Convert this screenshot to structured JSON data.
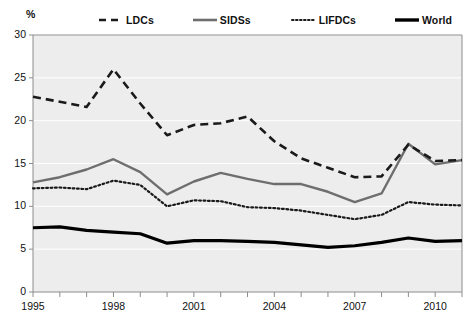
{
  "chart_data": {
    "type": "line",
    "title": "",
    "xlabel": "",
    "ylabel": "%",
    "ylim": [
      0,
      30
    ],
    "xlim": [
      1995,
      2011
    ],
    "yticks": [
      0,
      5,
      10,
      15,
      20,
      25,
      30
    ],
    "xticks": [
      1995,
      1998,
      2001,
      2004,
      2007,
      2010
    ],
    "grid": true,
    "legend_position": "top",
    "x": [
      1995,
      1996,
      1997,
      1998,
      1999,
      2000,
      2001,
      2002,
      2003,
      2004,
      2005,
      2006,
      2007,
      2008,
      2009,
      2010,
      2011
    ],
    "series": [
      {
        "name": "LDCs",
        "style": "dashed",
        "color": "#1a1a1a",
        "values": [
          22.8,
          22.2,
          21.6,
          26.0,
          22.0,
          18.3,
          19.5,
          19.7,
          20.5,
          17.6,
          15.6,
          14.5,
          13.4,
          13.5,
          17.2,
          15.3,
          15.4
        ]
      },
      {
        "name": "SIDSs",
        "style": "solid-medium",
        "color": "#6e6e6e",
        "values": [
          12.8,
          13.4,
          14.3,
          15.5,
          14.0,
          11.4,
          12.9,
          13.9,
          13.2,
          12.6,
          12.6,
          11.7,
          10.5,
          11.5,
          17.3,
          14.9,
          15.4
        ]
      },
      {
        "name": "LIFDCs",
        "style": "dotted",
        "color": "#1a1a1a",
        "values": [
          12.1,
          12.2,
          12.0,
          13.0,
          12.5,
          10.0,
          10.7,
          10.6,
          9.9,
          9.8,
          9.5,
          9.0,
          8.5,
          9.0,
          10.5,
          10.2,
          10.1
        ]
      },
      {
        "name": "World",
        "style": "solid-thick",
        "color": "#000000",
        "values": [
          7.5,
          7.6,
          7.2,
          7.0,
          6.8,
          5.7,
          6.0,
          6.0,
          5.9,
          5.8,
          5.5,
          5.2,
          5.4,
          5.8,
          6.3,
          5.9,
          6.0
        ]
      }
    ]
  },
  "legend": {
    "items": [
      {
        "label": "LDCs"
      },
      {
        "label": "SIDSs"
      },
      {
        "label": "LIFDCs"
      },
      {
        "label": "World"
      }
    ]
  },
  "axes": {
    "y_unit_label": "%",
    "y_tick_labels": [
      "30",
      "25",
      "20",
      "15",
      "10",
      "5",
      "0"
    ],
    "x_tick_labels": [
      "1995",
      "1998",
      "2001",
      "2004",
      "2007",
      "2010"
    ]
  },
  "colors": {
    "plot_background": "#ededed",
    "gridline": "#ffffff",
    "axis": "#8c8c8c",
    "text": "#111111",
    "ldcs": "#1a1a1a",
    "sidss": "#6e6e6e",
    "lifdcs": "#1a1a1a",
    "world": "#000000"
  }
}
